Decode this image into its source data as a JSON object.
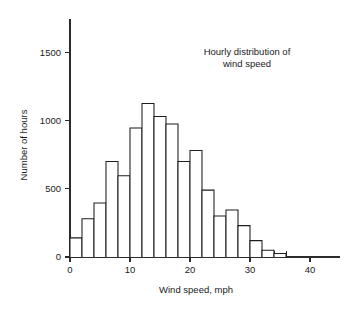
{
  "chart_data": {
    "type": "bar",
    "title_line1": "Hourly distribution of",
    "title_line2": "wind speed",
    "xlabel": "Wind speed, mph",
    "ylabel": "Number of hours",
    "xlim": [
      0,
      42
    ],
    "ylim": [
      0,
      1700
    ],
    "grid": false,
    "legend": false,
    "bin_width": 2,
    "xticks": [
      0,
      10,
      20,
      30,
      40
    ],
    "xtick_labels": [
      "0",
      "10",
      "20",
      "30",
      "40"
    ],
    "xminor_step": 2,
    "yticks": [
      0,
      500,
      1000,
      1500
    ],
    "ytick_labels": [
      "0",
      "500",
      "1000",
      "1500"
    ],
    "bin_starts": [
      0,
      2,
      4,
      6,
      8,
      10,
      12,
      14,
      16,
      18,
      20,
      22,
      24,
      26,
      28,
      30,
      32,
      34
    ],
    "bin_labels": [
      "0-2",
      "2-4",
      "4-6",
      "6-8",
      "8-10",
      "10-12",
      "12-14",
      "14-16",
      "16-18",
      "18-20",
      "20-22",
      "22-24",
      "24-26",
      "26-28",
      "28-30",
      "30-32",
      "32-34",
      "34-36"
    ],
    "values": [
      140,
      280,
      395,
      700,
      595,
      945,
      1125,
      1030,
      975,
      700,
      780,
      490,
      300,
      345,
      230,
      120,
      50,
      25
    ],
    "bar_fill": "#ffffff",
    "bar_stroke": "#1d1d1d",
    "axis_color": "#2b2b2b"
  }
}
